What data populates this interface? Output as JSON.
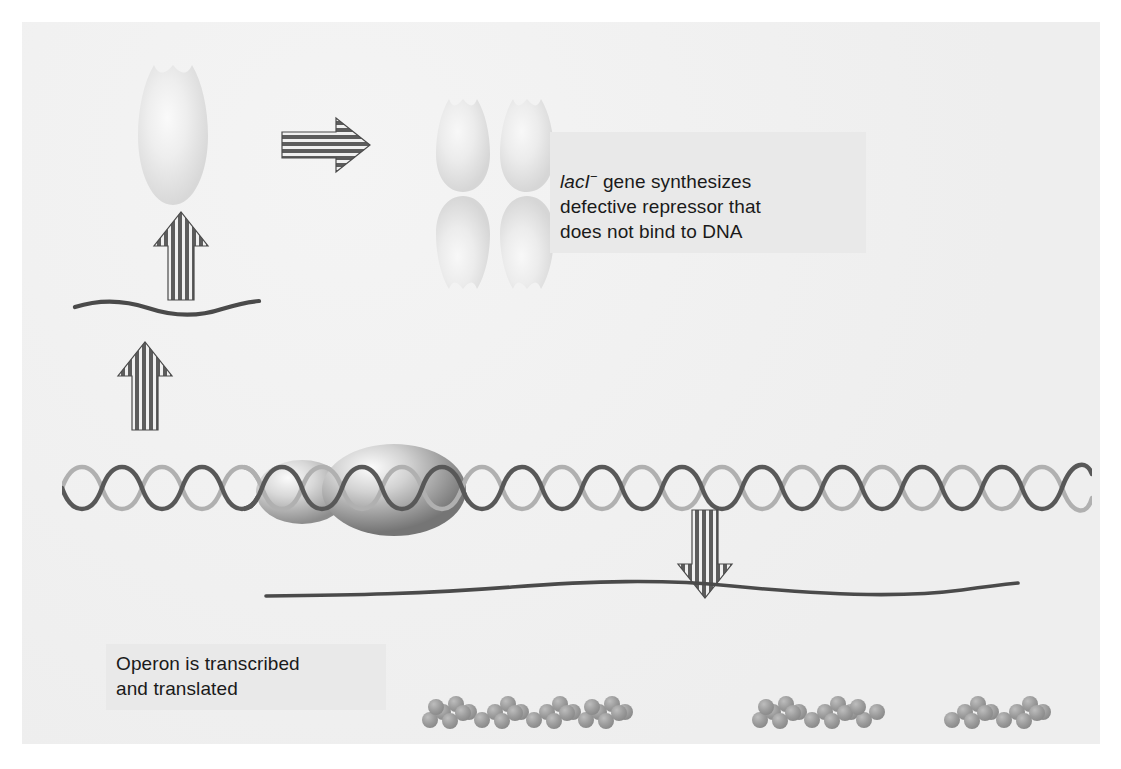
{
  "figure": {
    "background_color": "#f0f0f0",
    "frame_color": "#ffffff"
  },
  "captions": [
    {
      "id": "lacI-caption",
      "gene_name": "lacI",
      "superscript": "−",
      "text": " gene synthesizes\ndefective repressor that\ndoes not bind to DNA",
      "full_text": "lacI− gene synthesizes defective repressor that does not bind to DNA",
      "background_color": "#e9e9e9",
      "text_color": "#1a1a1a"
    },
    {
      "id": "operon-caption",
      "text": "Operon is transcribed\nand translated",
      "background_color": "#e9e9e9",
      "text_color": "#1a1a1a"
    }
  ],
  "elements": {
    "monomer": {
      "label": "defective repressor monomer",
      "fill_light": "#f2f2f2",
      "fill_mid": "#e2e2e2",
      "fill_edge": "#d2d2d2"
    },
    "tetramer": {
      "label": "defective repressor tetramer",
      "subunit_count": 4
    },
    "arrow_right": {
      "label": "assembly arrow",
      "direction": "right",
      "stripe_orientation": "horizontal",
      "stripe_color": "#5c5c5c"
    },
    "arrow_translation": {
      "label": "translation arrow",
      "direction": "up",
      "stripe_orientation": "vertical",
      "stripe_color": "#5c5c5c"
    },
    "arrow_transcription": {
      "label": "transcription arrow",
      "direction": "up",
      "stripe_orientation": "vertical",
      "stripe_color": "#5c5c5c"
    },
    "arrow_down": {
      "label": "transcription arrow to mRNA",
      "direction": "down",
      "stripe_orientation": "vertical",
      "stripe_color": "#5c5c5c"
    },
    "mrna_short": {
      "label": "lacI mRNA transcript",
      "color": "#4a4a4a"
    },
    "mrna_long": {
      "label": "polycistronic lac operon mRNA",
      "color": "#4a4a4a"
    },
    "dna": {
      "label": "DNA double helix",
      "strand_dark": "#555555",
      "strand_light": "#a8a8a8",
      "turns": 26
    },
    "rna_polymerase": {
      "label": "RNA polymerase",
      "lobes": 2,
      "color_highlight": "#f4f4f4",
      "color_shadow": "#6e6e6e"
    },
    "protein_chains": [
      {
        "label": "beta-galactosidase polypeptide",
        "bead_count": 26,
        "color": "#9a9a9a"
      },
      {
        "label": "permease polypeptide",
        "bead_count": 16,
        "color": "#9a9a9a"
      },
      {
        "label": "transacetylase polypeptide",
        "bead_count": 12,
        "color": "#9a9a9a"
      }
    ]
  }
}
